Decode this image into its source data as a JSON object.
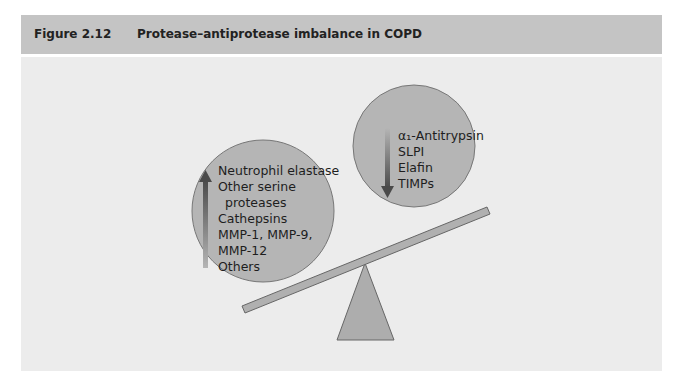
{
  "figure": {
    "number": "Figure 2.12",
    "title": "Protease–antiprotease imbalance in COPD"
  },
  "diagram": {
    "type": "balance-scale",
    "heavy_side": {
      "position": "left-low",
      "arrow": "up",
      "label_lines": [
        "Neutrophil elastase",
        "Other serine",
        "proteases",
        "Cathepsins",
        "MMP-1, MMP-9,",
        "MMP-12",
        "Others"
      ]
    },
    "light_side": {
      "position": "right-high",
      "arrow": "down",
      "label_lines": [
        "α₁-Antitrypsin",
        "SLPI",
        "Elafin",
        "TIMPs"
      ]
    },
    "colors": {
      "header_bg": "#c4c4c4",
      "panel_bg": "#ececec",
      "circle_fill": "#b5b5b5",
      "beam_fill": "#b0b0b0",
      "fulcrum_fill": "#adadad",
      "arrow": "#555555"
    }
  }
}
